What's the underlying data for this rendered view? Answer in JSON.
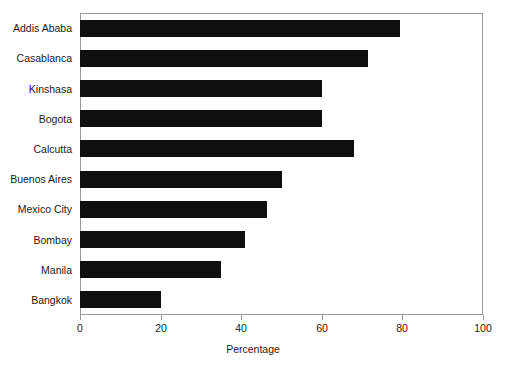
{
  "chart_data": {
    "type": "bar",
    "orientation": "horizontal",
    "title": "",
    "xlabel": "Percentage",
    "ylabel": "",
    "xlim": [
      0,
      100
    ],
    "xticks": [
      0,
      20,
      40,
      60,
      80,
      100
    ],
    "xtick_labels": [
      "0",
      "20",
      "40",
      "60",
      "80",
      "100"
    ],
    "grid": false,
    "legend": false,
    "bar_color": "#100f0f",
    "frame_color": "#9a9a9a",
    "background_color": "#ffffff",
    "categories": [
      "Addis Ababa",
      "Casablanca",
      "Kinshasa",
      "Bogota",
      "Calcutta",
      "Buenos Aires",
      "Mexico City",
      "Bombay",
      "Manila",
      "Bangkok"
    ],
    "values": [
      79.5,
      71.5,
      60,
      60,
      68,
      50,
      46.5,
      41,
      35,
      20
    ]
  }
}
